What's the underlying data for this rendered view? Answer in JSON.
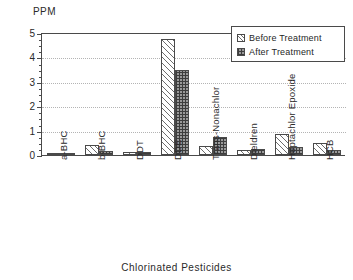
{
  "chart_data": {
    "type": "bar",
    "title": "",
    "xlabel": "Chlorinated Pesticides",
    "ylabel": "PPM",
    "ylim": [
      0,
      5
    ],
    "yticks": [
      0,
      1,
      2,
      3,
      4,
      5
    ],
    "ytick_labels": [
      "0",
      "1",
      "2",
      "3",
      "4",
      "5"
    ],
    "grid": true,
    "legend_position": "top-right",
    "categories": [
      "a-BHC",
      "b-BHC",
      "DDT",
      "DDE",
      "Trans-Nonachlor",
      "Dieldren",
      "Heptachlor Epoxide",
      "HCB"
    ],
    "series": [
      {
        "name": "Before Treatment",
        "pattern": "diagonal-hatch",
        "values": [
          0.06,
          0.42,
          0.14,
          4.75,
          0.35,
          0.19,
          0.85,
          0.5
        ]
      },
      {
        "name": "After Treatment",
        "pattern": "checker",
        "values": [
          0.02,
          0.15,
          0.14,
          3.48,
          0.74,
          0.26,
          0.34,
          0.21
        ]
      }
    ]
  },
  "axes": {
    "y_title": "PPM",
    "x_title": "Chlorinated Pesticides"
  },
  "legend": {
    "items": [
      {
        "label": "Before Treatment"
      },
      {
        "label": "After Treatment"
      }
    ]
  },
  "colors": {
    "axis": "#4a4a4a",
    "grid": "#b4b4b4",
    "before_fill": "#ffffff",
    "after_fill": "#9a9a9a",
    "text": "#2a2a2a",
    "background": "#ffffff"
  }
}
